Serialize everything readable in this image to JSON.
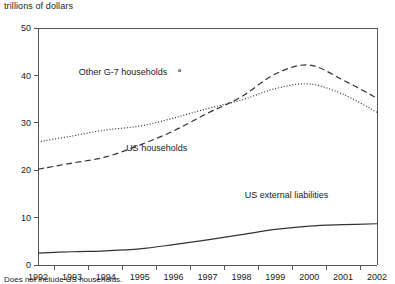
{
  "figure": {
    "unit_label": "trillions of dollars",
    "footnote": "Does not include US households."
  },
  "chart_data": {
    "type": "line",
    "title": "",
    "subtitle": "",
    "xlabel": "",
    "ylabel": "trillions of dollars",
    "x": [
      1992,
      1993,
      1994,
      1995,
      1996,
      1997,
      1998,
      1999,
      2000,
      2001,
      2002
    ],
    "categories": [
      "1992",
      "1993",
      "1994",
      "1995",
      "1996",
      "1997",
      "1998",
      "1999",
      "2000",
      "2001",
      "2002"
    ],
    "xlim": [
      1992,
      2002
    ],
    "ylim": [
      0,
      50
    ],
    "yticks": [
      0,
      10,
      20,
      30,
      40,
      50
    ],
    "ytick_labels": [
      "0",
      "10",
      "20",
      "30",
      "40",
      "50"
    ],
    "grid": false,
    "legend": "inline-annotations",
    "series": [
      {
        "name": "Other G-7 households",
        "name_superscript": "a",
        "style": "dotted",
        "color": "#333333",
        "annotation": "Other G-7 households",
        "values": [
          26.0,
          27.2,
          28.5,
          29.3,
          31.0,
          33.0,
          34.8,
          37.2,
          38.2,
          36.0,
          32.2
        ]
      },
      {
        "name": "US households",
        "style": "dashed",
        "color": "#333333",
        "annotation": "US households",
        "values": [
          20.2,
          21.5,
          22.8,
          25.3,
          28.3,
          32.0,
          35.5,
          40.3,
          42.2,
          39.0,
          35.2
        ]
      },
      {
        "name": "US external liabilities",
        "style": "solid",
        "color": "#333333",
        "annotation": "US external liabilities",
        "values": [
          2.5,
          2.8,
          3.0,
          3.4,
          4.3,
          5.3,
          6.4,
          7.5,
          8.2,
          8.5,
          8.7
        ]
      }
    ],
    "annotations": [
      {
        "text": "Other G-7 households",
        "superscript": "a",
        "x": 1993.2,
        "y": 40.0
      },
      {
        "text": "US households",
        "x": 1994.6,
        "y": 24.0
      },
      {
        "text": "US external liabilities",
        "x": 1998.1,
        "y": 14.2
      }
    ]
  }
}
